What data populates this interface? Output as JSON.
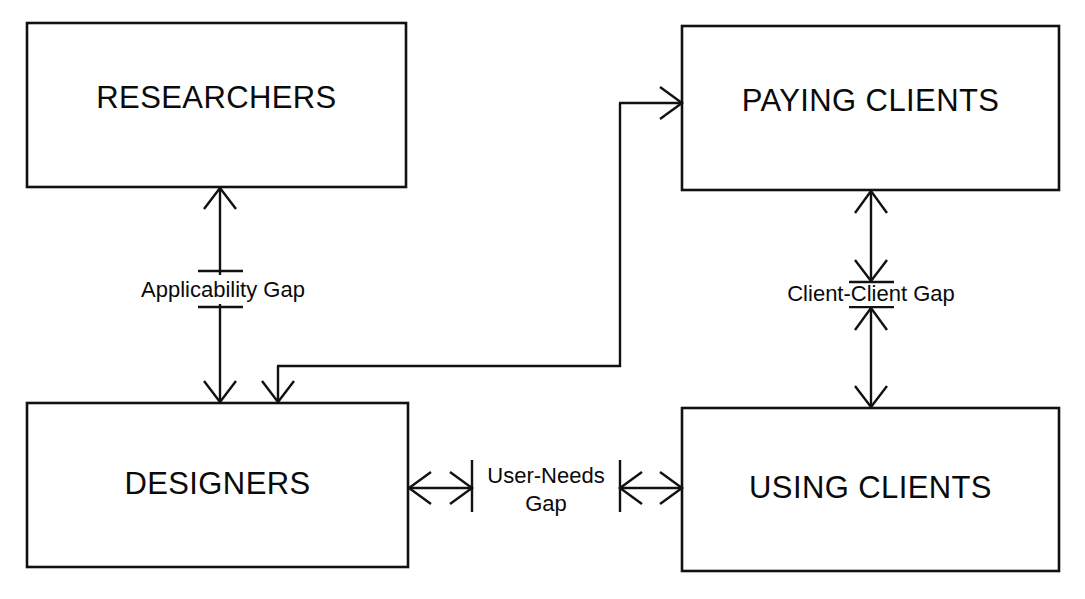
{
  "diagram": {
    "background_color": "#ffffff",
    "line_color": "#111111",
    "text_color": "#0a0a0a",
    "nodes": [
      {
        "id": "researchers",
        "label": "RESEARCHERS",
        "x": 27,
        "y": 23,
        "w": 379,
        "h": 164
      },
      {
        "id": "paying_clients",
        "label": "PAYING CLIENTS",
        "x": 682,
        "y": 26,
        "w": 377,
        "h": 164
      },
      {
        "id": "designers",
        "label": "DESIGNERS",
        "x": 27,
        "y": 403,
        "w": 381,
        "h": 164
      },
      {
        "id": "using_clients",
        "label": "USING CLIENTS",
        "x": 682,
        "y": 408,
        "w": 377,
        "h": 163
      }
    ],
    "gaps": [
      {
        "id": "applicability_gap",
        "label": "Applicability Gap",
        "lines": [
          "Applicability Gap"
        ],
        "between": [
          "researchers",
          "designers"
        ],
        "orientation": "vertical",
        "arrowheads": "both"
      },
      {
        "id": "client_client_gap",
        "label": "Client-Client Gap",
        "lines": [
          "Client-Client Gap"
        ],
        "between": [
          "paying_clients",
          "using_clients"
        ],
        "orientation": "vertical",
        "arrowheads": "both"
      },
      {
        "id": "user_needs_gap",
        "label": "User-Needs Gap",
        "lines": [
          "User-Needs",
          "Gap"
        ],
        "between": [
          "designers",
          "using_clients"
        ],
        "orientation": "horizontal",
        "arrowheads": "both"
      }
    ],
    "connectors": [
      {
        "id": "designers-to-paying-clients",
        "from": "designers",
        "to": "paying_clients",
        "style": "elbow",
        "arrowhead": "to"
      },
      {
        "id": "elbow-branch-into-designers",
        "from": "elbow",
        "to": "designers",
        "style": "elbow",
        "arrowhead": "to"
      }
    ]
  }
}
